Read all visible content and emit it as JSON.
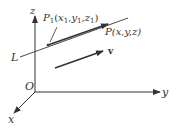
{
  "diagram": {
    "type": "3d-line-vector",
    "axes": {
      "origin_label": "O",
      "x_label": "x",
      "y_label": "y",
      "z_label": "z"
    },
    "line": {
      "label": "L"
    },
    "points": {
      "p1": {
        "name": "P",
        "sub": "1",
        "coords_open": "(",
        "x": "x",
        "x_sub": "1",
        "y": "y",
        "y_sub": "1",
        "z": "z",
        "z_sub": "1",
        "coords_close": ")"
      },
      "p": {
        "label": "P(x,y,z)"
      }
    },
    "vector": {
      "label": "v"
    },
    "colors": {
      "stroke": "#333333",
      "background": "#ffffff"
    }
  }
}
